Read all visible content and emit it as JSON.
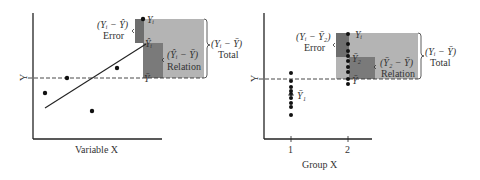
{
  "colors": {
    "total_box": "#b4b4b4",
    "error_box": "#6e6e6e",
    "relation_box": "#7a7a7a",
    "axis": "#222222",
    "text": "#333333"
  },
  "left_panel": {
    "x_axis_label": "Variable X",
    "y_axis_label": "Y",
    "mean_label": "Ȳ",
    "yi_label": "Yᵢ",
    "yhat_label": "Ŷᵢ",
    "error_expr": "(Yᵢ − Ŷ)",
    "error_label": "Error",
    "relation_expr": "(Ŷᵢ − Ȳ)",
    "relation_label": "Relation",
    "total_expr": "(Yᵢ − Ȳ)",
    "total_label": "Total"
  },
  "right_panel": {
    "x_axis_label": "Group X",
    "y_axis_label": "Y",
    "tick_1": "1",
    "tick_2": "2",
    "mean_label": "Ȳ",
    "group1_mean_label": "Ȳ₁",
    "group2_mean_label": "Ȳ₂",
    "yi_label": "Yᵢ",
    "error_expr": "(Yᵢ − Ȳ₂)",
    "error_label": "Error",
    "relation_expr": "(Ȳ₂ − Ȳ)",
    "relation_label": "Relation",
    "total_expr": "(Yᵢ − Ȳ)",
    "total_label": "Total"
  }
}
